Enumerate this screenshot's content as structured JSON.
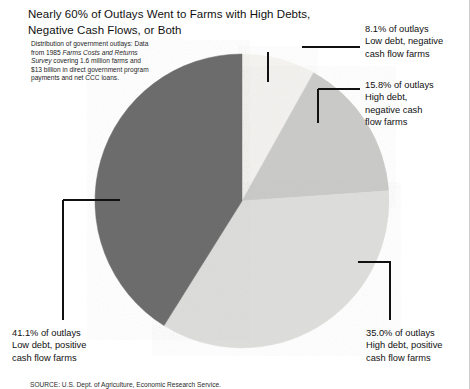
{
  "title": "Nearly 60% of Outlays Went to Farms with High Debts, Negative Cash Flows, or Both",
  "note": {
    "line1": "Distribution of government outlays:",
    "line2": "Data from 1985 ",
    "line2_italic": "Farms Costs and",
    "line3_italic": "Returns Survey",
    "line3": " covering 1.6 million",
    "line4": "farms and $13 billion in direct",
    "line5": "government program payments",
    "line6": "and net CCC loans."
  },
  "callouts": {
    "low_debt_negative": {
      "pct": "8.1% of outlays",
      "desc_line1": "Low debt, negative",
      "desc_line2": "cash flow farms"
    },
    "high_debt_negative": {
      "pct": "15.8% of outlays",
      "desc_line1": "High debt,",
      "desc_line2": "negative cash",
      "desc_line3": "flow farms"
    },
    "high_debt_positive": {
      "pct": "35.0% of outlays",
      "desc_line1": "High debt, positive",
      "desc_line2": "cash flow farms"
    },
    "low_debt_positive": {
      "pct": "41.1% of outlays",
      "desc_line1": "Low debt, positive",
      "desc_line2": "cash flow farms"
    }
  },
  "source": "SOURCE: U.S. Dept. of Agriculture, Economic Research Service.",
  "chart_data": {
    "type": "pie",
    "title": "Nearly 60% of Outlays Went to Farms with High Debts, Negative Cash Flows, or Both",
    "subtitle": "Distribution of government outlays: Data from 1985 Farms Costs and Returns Survey covering 1.6 million farms and $13 billion in direct government program payments and net CCC loans.",
    "unit": "percent of outlays",
    "start_angle_deg": 0,
    "direction": "clockwise",
    "legend": "none",
    "grid": false,
    "labels": [
      "Low debt, negative cash flow farms",
      "High debt, negative cash flow farms",
      "High debt, positive cash flow farms",
      "Low debt, positive cash flow farms"
    ],
    "values": [
      8.1,
      15.8,
      35.0,
      41.1
    ],
    "colors": [
      "#f3f2ef",
      "#c9c9c7",
      "#dcdcda",
      "#6c6c6c"
    ],
    "total": 100.0
  },
  "geometry": {
    "center_x": 242,
    "center_y": 201,
    "radius": 147
  }
}
